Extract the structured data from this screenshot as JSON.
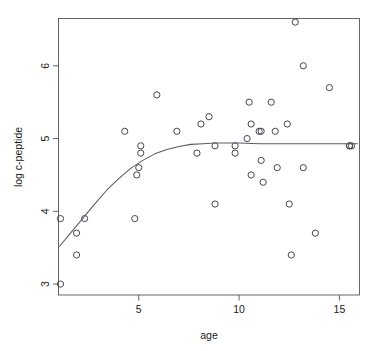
{
  "chart_data": {
    "type": "scatter",
    "title": "",
    "xlabel": "age",
    "ylabel": "log c-peptide",
    "xlim": [
      1.0,
      16.0
    ],
    "ylim": [
      2.85,
      6.65
    ],
    "grid": false,
    "legend": null,
    "x_ticks": [
      5,
      10,
      15
    ],
    "x_tick_labels": [
      "5",
      "10",
      "15"
    ],
    "y_ticks": [
      3,
      4,
      5,
      6
    ],
    "y_tick_labels": [
      "3",
      "4",
      "5",
      "6"
    ],
    "points": [
      {
        "x": 1.1,
        "y": 3.0
      },
      {
        "x": 1.1,
        "y": 3.9
      },
      {
        "x": 1.9,
        "y": 3.7
      },
      {
        "x": 1.9,
        "y": 3.4
      },
      {
        "x": 2.3,
        "y": 3.9
      },
      {
        "x": 4.3,
        "y": 5.1
      },
      {
        "x": 4.8,
        "y": 3.9
      },
      {
        "x": 4.9,
        "y": 4.5
      },
      {
        "x": 5.0,
        "y": 4.6
      },
      {
        "x": 5.1,
        "y": 4.9
      },
      {
        "x": 5.1,
        "y": 4.8
      },
      {
        "x": 5.9,
        "y": 5.6
      },
      {
        "x": 6.9,
        "y": 5.1
      },
      {
        "x": 7.9,
        "y": 4.8
      },
      {
        "x": 8.1,
        "y": 5.2
      },
      {
        "x": 8.5,
        "y": 5.3
      },
      {
        "x": 8.8,
        "y": 4.1
      },
      {
        "x": 8.8,
        "y": 4.9
      },
      {
        "x": 9.8,
        "y": 4.9
      },
      {
        "x": 9.8,
        "y": 4.8
      },
      {
        "x": 10.4,
        "y": 5.0
      },
      {
        "x": 10.5,
        "y": 5.5
      },
      {
        "x": 10.6,
        "y": 5.2
      },
      {
        "x": 10.6,
        "y": 4.5
      },
      {
        "x": 11.0,
        "y": 5.1
      },
      {
        "x": 11.1,
        "y": 5.1
      },
      {
        "x": 11.1,
        "y": 4.7
      },
      {
        "x": 11.2,
        "y": 4.4
      },
      {
        "x": 11.6,
        "y": 5.5
      },
      {
        "x": 11.8,
        "y": 5.1
      },
      {
        "x": 11.9,
        "y": 4.6
      },
      {
        "x": 12.4,
        "y": 5.2
      },
      {
        "x": 12.5,
        "y": 4.1
      },
      {
        "x": 12.6,
        "y": 3.4
      },
      {
        "x": 12.8,
        "y": 6.6
      },
      {
        "x": 13.2,
        "y": 6.0
      },
      {
        "x": 13.2,
        "y": 4.6
      },
      {
        "x": 13.8,
        "y": 3.7
      },
      {
        "x": 14.5,
        "y": 5.7
      },
      {
        "x": 15.5,
        "y": 4.9
      },
      {
        "x": 15.5,
        "y": 4.9
      },
      {
        "x": 15.6,
        "y": 4.9
      }
    ],
    "smooth_curve": {
      "name": "lowess-smoother",
      "x": [
        1.05,
        1.6,
        2.2,
        2.8,
        3.4,
        4.0,
        4.6,
        5.2,
        5.8,
        6.4,
        7.0,
        7.6,
        8.2,
        8.8,
        9.4,
        10.0,
        11.0,
        12.0,
        13.0,
        14.0,
        15.0,
        15.9
      ],
      "y": [
        3.52,
        3.7,
        3.9,
        4.1,
        4.29,
        4.45,
        4.59,
        4.7,
        4.79,
        4.85,
        4.89,
        4.92,
        4.93,
        4.94,
        4.94,
        4.94,
        4.93,
        4.93,
        4.93,
        4.93,
        4.93,
        4.93
      ]
    },
    "marker": {
      "shape": "open-circle",
      "color": "#3c3c47",
      "size_px": 3.1
    },
    "curve_color": "#5a5a66",
    "frame_color": "#555555",
    "background_color": "#ffffff"
  }
}
